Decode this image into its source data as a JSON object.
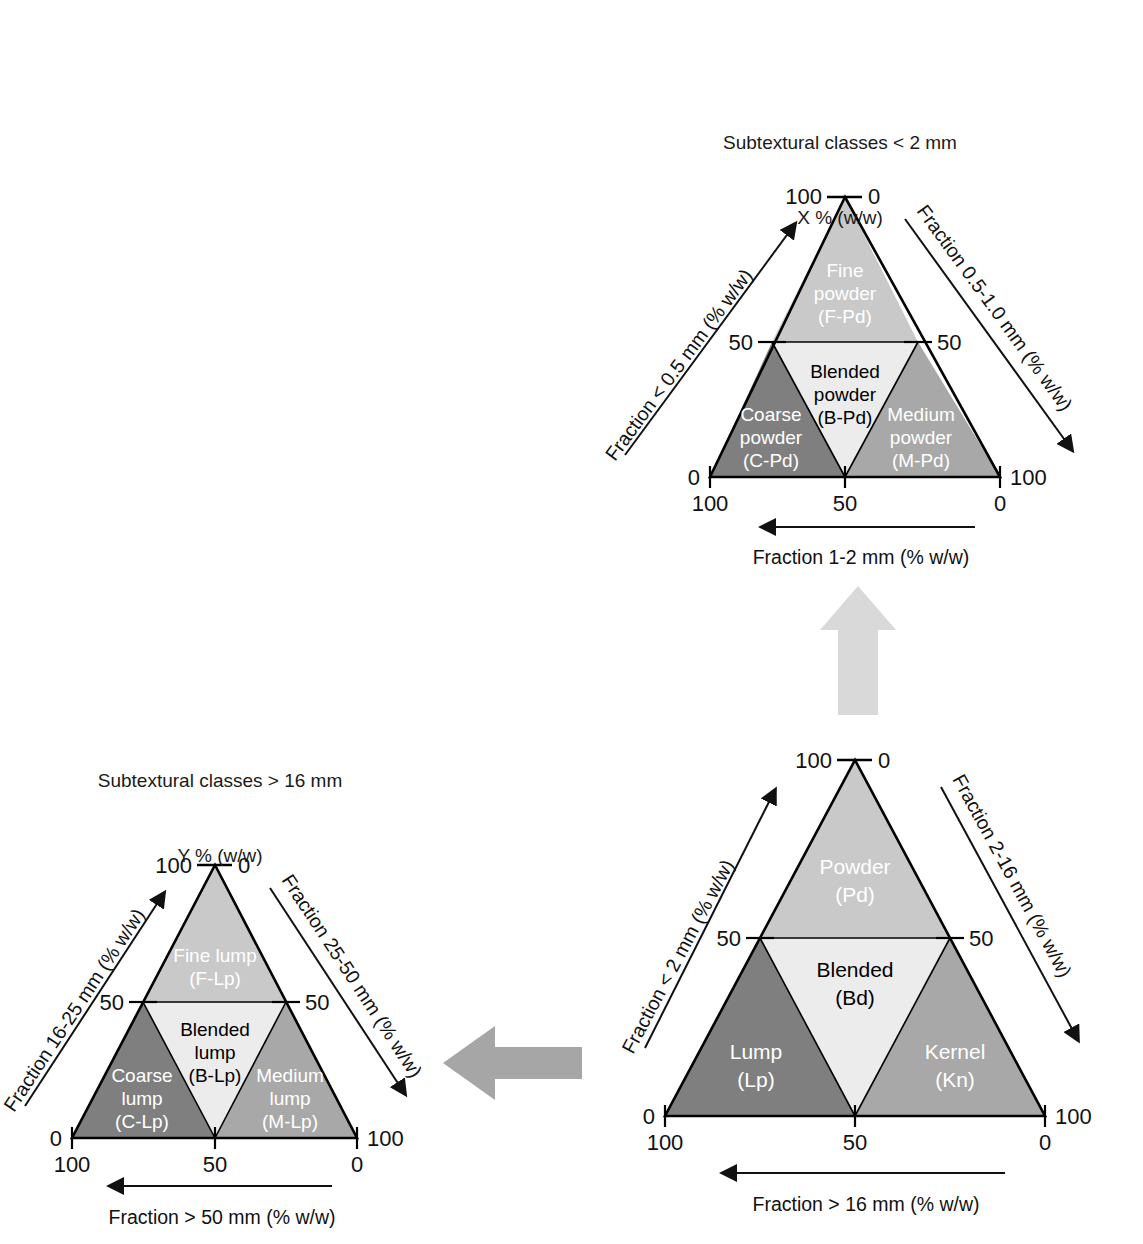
{
  "figure": {
    "type": "ternary-classification-diagrams",
    "background": "#ffffff",
    "flow_arrows": [
      {
        "name": "arrow-up-powder",
        "direction": "up",
        "color": "#d9d9d9"
      },
      {
        "name": "arrow-left-lump",
        "direction": "left",
        "color": "#a6a6a6"
      }
    ]
  },
  "palette": {
    "fine": "#c9c9c9",
    "blended": "#ececec",
    "coarse": "#7f7f7f",
    "medium": "#a8a8a8",
    "outline": "#000000",
    "arrow_light": "#d9d9d9",
    "arrow_mid": "#a6a6a6"
  },
  "diagrams": [
    {
      "id": "powder",
      "title_line1": "Subtextural classes < 2 mm",
      "title_line2": "X % (w/w)",
      "axes": {
        "left": "Fraction < 0.5 mm (% w/w)",
        "right": "Fraction 0.5-1.0 mm (% w/w)",
        "bottom": "Fraction 1-2 mm (% w/w)"
      },
      "ticks": {
        "apex_left": "100",
        "apex_right": "0",
        "mid_left": "50",
        "mid_right": "50",
        "base_left_outer": "0",
        "base_right_outer": "100",
        "base_left_inner": "100",
        "base_mid": "50",
        "base_right_inner": "0"
      },
      "fields": [
        {
          "name": "fine-powder",
          "label_line1": "Fine",
          "label_line2": "powder",
          "code": "(F-Pd)",
          "fill": "#c9c9c9",
          "text": "#ffffff"
        },
        {
          "name": "blended-powder",
          "label_line1": "Blended",
          "label_line2": "powder",
          "code": "(B-Pd)",
          "fill": "#ececec",
          "text": "#000000"
        },
        {
          "name": "coarse-powder",
          "label_line1": "Coarse",
          "label_line2": "powder",
          "code": "(C-Pd)",
          "fill": "#7f7f7f",
          "text": "#ffffff"
        },
        {
          "name": "medium-powder",
          "label_line1": "Medium",
          "label_line2": "powder",
          "code": "(M-Pd)",
          "fill": "#a8a8a8",
          "text": "#ffffff"
        }
      ]
    },
    {
      "id": "whole",
      "title_line1": "",
      "title_line2": "",
      "axes": {
        "left": "Fraction < 2 mm (% w/w)",
        "right": "Fraction 2-16 mm (% w/w)",
        "bottom": "Fraction > 16 mm (% w/w)"
      },
      "ticks": {
        "apex_left": "100",
        "apex_right": "0",
        "mid_left": "50",
        "mid_right": "50",
        "base_left_outer": "0",
        "base_right_outer": "100",
        "base_left_inner": "100",
        "base_mid": "50",
        "base_right_inner": "0"
      },
      "fields": [
        {
          "name": "powder",
          "label_line1": "Powder",
          "label_line2": "",
          "code": "(Pd)",
          "fill": "#c9c9c9",
          "text": "#ffffff"
        },
        {
          "name": "blended",
          "label_line1": "Blended",
          "label_line2": "",
          "code": "(Bd)",
          "fill": "#ececec",
          "text": "#000000"
        },
        {
          "name": "lump",
          "label_line1": "Lump",
          "label_line2": "",
          "code": "(Lp)",
          "fill": "#7f7f7f",
          "text": "#ffffff"
        },
        {
          "name": "kernel",
          "label_line1": "Kernel",
          "label_line2": "",
          "code": "(Kn)",
          "fill": "#a8a8a8",
          "text": "#ffffff"
        }
      ]
    },
    {
      "id": "lump",
      "title_line1": "Subtextural classes > 16 mm",
      "title_line2": "Y % (w/w)",
      "axes": {
        "left": "Fraction 16-25 mm (% w/w)",
        "right": "Fraction 25-50 mm (% w/w)",
        "bottom": "Fraction > 50 mm (% w/w)"
      },
      "ticks": {
        "apex_left": "100",
        "apex_right": "0",
        "mid_left": "50",
        "mid_right": "50",
        "base_left_outer": "0",
        "base_right_outer": "100",
        "base_left_inner": "100",
        "base_mid": "50",
        "base_right_inner": "0"
      },
      "fields": [
        {
          "name": "fine-lump",
          "label_line1": "Fine lump",
          "label_line2": "",
          "code": "(F-Lp)",
          "fill": "#c9c9c9",
          "text": "#ffffff"
        },
        {
          "name": "blended-lump",
          "label_line1": "Blended",
          "label_line2": "lump",
          "code": "(B-Lp)",
          "fill": "#ececec",
          "text": "#000000"
        },
        {
          "name": "coarse-lump",
          "label_line1": "Coarse",
          "label_line2": "lump",
          "code": "(C-Lp)",
          "fill": "#7f7f7f",
          "text": "#ffffff"
        },
        {
          "name": "medium-lump",
          "label_line1": "Medium",
          "label_line2": "lump",
          "code": "(M-Lp)",
          "fill": "#a8a8a8",
          "text": "#ffffff"
        }
      ]
    }
  ]
}
